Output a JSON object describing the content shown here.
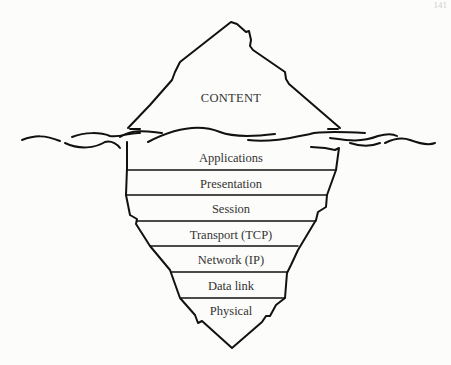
{
  "page_number": "141",
  "diagram": {
    "title_above_water": "CONTENT",
    "layers": [
      {
        "label": "Applications",
        "y": 158
      },
      {
        "label": "Presentation",
        "y": 184
      },
      {
        "label": "Session",
        "y": 209
      },
      {
        "label": "Transport (TCP)",
        "y": 235
      },
      {
        "label": "Network (IP)",
        "y": 260
      },
      {
        "label": "Data link",
        "y": 286
      },
      {
        "label": "Physical",
        "y": 311
      }
    ],
    "stroke_color": "#111111",
    "text_color": "#333333"
  }
}
